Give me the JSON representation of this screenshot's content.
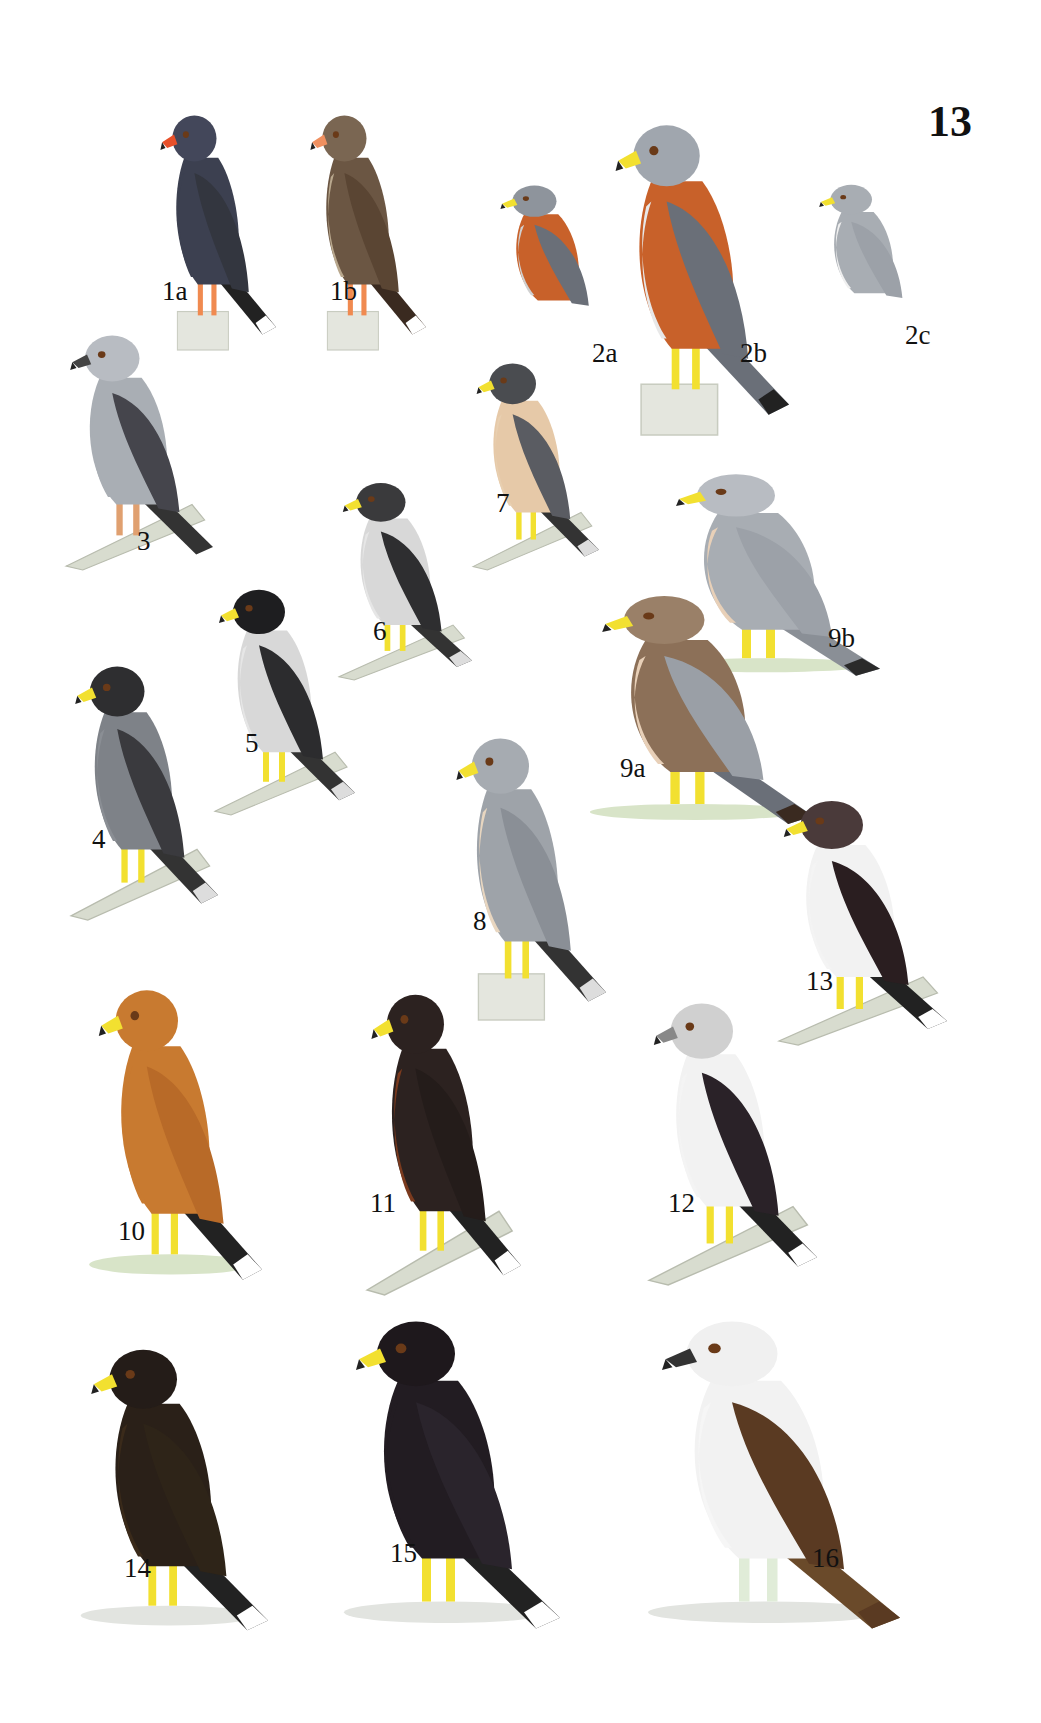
{
  "plate": {
    "number": "13"
  },
  "birds": [
    {
      "id": "1a",
      "label": "1a",
      "body": "#3c4050",
      "wing": "#33363f",
      "head": "#43475a",
      "belly": "#3c4050",
      "beak": "#e8502a",
      "legs": "#f08a50",
      "tail": "#222",
      "tailTip": "#ffffff",
      "perch": "post"
    },
    {
      "id": "1b",
      "label": "1b",
      "body": "#6b5643",
      "wing": "#5a4533",
      "head": "#7a6652",
      "belly": "#b9a88e",
      "beak": "#f09060",
      "legs": "#f08a50",
      "tail": "#3a2a20",
      "tailTip": "#ffffff",
      "perch": "post"
    },
    {
      "id": "2a",
      "label": "2a",
      "body": "#c8612a",
      "wing": "#6a6f78",
      "head": "#8e949c",
      "belly": "#d0d0d0",
      "beak": "#f2e030",
      "legs": "none",
      "tail": "none",
      "tailTip": "none",
      "perch": "none"
    },
    {
      "id": "2b",
      "label": "2b",
      "body": "#c8612a",
      "wing": "#6a6f78",
      "head": "#a0a6ae",
      "belly": "#e8e8e8",
      "beak": "#f2e030",
      "legs": "#f2e030",
      "tail": "#6a6f78",
      "tailTip": "#222",
      "perch": "post"
    },
    {
      "id": "2c",
      "label": "2c",
      "body": "#a8adb3",
      "wing": "#9ca1a8",
      "head": "#a8adb3",
      "belly": "#f0f0f0",
      "beak": "#f2e030",
      "legs": "none",
      "tail": "none",
      "tailTip": "none",
      "perch": "none"
    },
    {
      "id": "3",
      "label": "3",
      "body": "#a9aeb4",
      "wing": "#45454c",
      "head": "#b8bcc2",
      "belly": "#a9aeb4",
      "beak": "#444",
      "legs": "#e0a070",
      "tail": "#333",
      "tailTip": "none",
      "perch": "branch"
    },
    {
      "id": "4",
      "label": "4",
      "body": "#7e8288",
      "wing": "#3a3a3e",
      "head": "#2e2e30",
      "belly": "#8a8e94",
      "beak": "#f2e030",
      "legs": "#f2e030",
      "tail": "#333",
      "tailTip": "#ddd",
      "perch": "branch"
    },
    {
      "id": "5",
      "label": "5",
      "body": "#d8d8d8",
      "wing": "#2c2c2e",
      "head": "#1e1e20",
      "belly": "#e6e6e6",
      "beak": "#f2e030",
      "legs": "#f2e030",
      "tail": "#333",
      "tailTip": "#ddd",
      "perch": "branch"
    },
    {
      "id": "6",
      "label": "6",
      "body": "#d8d8d8",
      "wing": "#2e2e30",
      "head": "#3a3a3c",
      "belly": "#e6e6e6",
      "beak": "#f2e030",
      "legs": "#f2e030",
      "tail": "#333",
      "tailTip": "#ddd",
      "perch": "branch"
    },
    {
      "id": "7",
      "label": "7",
      "body": "#e6c9a8",
      "wing": "#5a5c62",
      "head": "#4a4c50",
      "belly": "#e8cfb0",
      "beak": "#f2e030",
      "legs": "#f2e030",
      "tail": "#333",
      "tailTip": "#ddd",
      "perch": "branch"
    },
    {
      "id": "8",
      "label": "8",
      "body": "#9ea3a9",
      "wing": "#8a8f96",
      "head": "#a6abb1",
      "belly": "#e8d6c0",
      "beak": "#f2e030",
      "legs": "#f2e030",
      "tail": "#333",
      "tailTip": "#ddd",
      "perch": "post"
    },
    {
      "id": "9a",
      "label": "9a",
      "body": "#8c7058",
      "wing": "#9a9fa6",
      "head": "#9a8068",
      "belly": "#e8d0b8",
      "beak": "#f2e030",
      "legs": "#f2e030",
      "tail": "#6a6f78",
      "tailTip": "#3a2a20",
      "perch": "grass"
    },
    {
      "id": "9b",
      "label": "9b",
      "body": "#a8adb3",
      "wing": "#9ca1a8",
      "head": "#b8bcc2",
      "belly": "#e8d0b8",
      "beak": "#f2e030",
      "legs": "#f2e030",
      "tail": "#8a8f96",
      "tailTip": "#2a2a2a",
      "perch": "grass"
    },
    {
      "id": "10",
      "label": "10",
      "body": "#c87a30",
      "wing": "#b86a28",
      "head": "#c87a30",
      "belly": "#c87a30",
      "beak": "#f2e030",
      "legs": "#f2e030",
      "tail": "#222",
      "tailTip": "#ffffff",
      "perch": "grass"
    },
    {
      "id": "11",
      "label": "11",
      "body": "#2c2220",
      "wing": "#241c1a",
      "head": "#2c2220",
      "belly": "#7a3a1e",
      "beak": "#f2e030",
      "legs": "#f2e030",
      "tail": "#222",
      "tailTip": "#ffffff",
      "perch": "branch"
    },
    {
      "id": "12",
      "label": "12",
      "body": "#f2f2f2",
      "wing": "#2a2228",
      "head": "#d0d0d0",
      "belly": "#f4f4f4",
      "beak": "#888",
      "legs": "#f2e030",
      "tail": "#222",
      "tailTip": "#ffffff",
      "perch": "branch"
    },
    {
      "id": "13",
      "label": "13",
      "body": "#f2f2f2",
      "wing": "#2a1e20",
      "head": "#4a3a3a",
      "belly": "#f4f4f4",
      "beak": "#f2e030",
      "legs": "#f2e030",
      "tail": "#222",
      "tailTip": "#ffffff",
      "perch": "branch"
    },
    {
      "id": "14",
      "label": "14",
      "body": "#2a2018",
      "wing": "#2e2418",
      "head": "#241c18",
      "belly": "#3a2a1a",
      "beak": "#f2e030",
      "legs": "#f2e030",
      "tail": "#222",
      "tailTip": "#ffffff",
      "perch": "ground"
    },
    {
      "id": "15",
      "label": "15",
      "body": "#221c22",
      "wing": "#2a242c",
      "head": "#1e181c",
      "belly": "#221c22",
      "beak": "#f2e030",
      "legs": "#f2e030",
      "tail": "#222",
      "tailTip": "#ffffff",
      "perch": "ground"
    },
    {
      "id": "16",
      "label": "16",
      "body": "#f2f2f2",
      "wing": "#5a3a22",
      "head": "#f0f0f0",
      "belly": "#f6f6f6",
      "beak": "#333",
      "legs": "#e0ecd8",
      "tail": "#6a4a2a",
      "tailTip": "#5a3a22",
      "perch": "ground"
    }
  ]
}
